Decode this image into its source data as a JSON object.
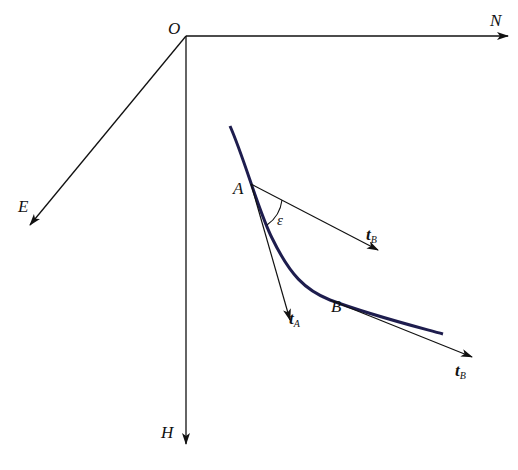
{
  "diagram": {
    "title": "",
    "axes": {
      "origin": "O",
      "north": "N",
      "east": "E",
      "vertical": "H"
    },
    "points": {
      "a": "A",
      "b": "B"
    },
    "angle": "ε",
    "vectors": {
      "t_a": {
        "base": "t",
        "sub": "A"
      },
      "t_b_at_a": {
        "base": "t",
        "sub": "B"
      },
      "t_b_at_b": {
        "base": "t",
        "sub": "B"
      }
    },
    "colors": {
      "curve": "#1e1d4e",
      "lines": "#111111",
      "background": "#ffffff"
    }
  }
}
